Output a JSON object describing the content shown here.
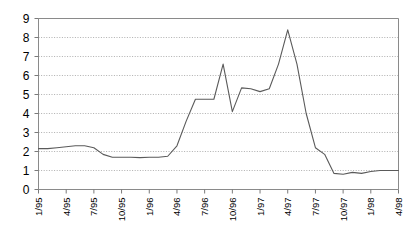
{
  "chart_data": {
    "type": "line",
    "title": "",
    "subtitle": "",
    "xlabel": "",
    "ylabel": "",
    "ylim": [
      0,
      9
    ],
    "yticks": [
      0,
      1,
      2,
      3,
      4,
      5,
      6,
      7,
      8,
      9
    ],
    "ytick_labels": [
      "0",
      "1",
      "2",
      "3",
      "4",
      "5",
      "6",
      "7",
      "8",
      "9"
    ],
    "grid": true,
    "grid_style": "dotted-horizontal",
    "legend": false,
    "legend_position": "none",
    "line_color": "#5a5a5a",
    "background_color": "#ffffff",
    "xtick_labels": [
      "1/95",
      "4/95",
      "7/95",
      "10/95",
      "1/96",
      "4/96",
      "7/96",
      "10/96",
      "1/97",
      "4/97",
      "7/97",
      "10/97",
      "1/98",
      "4/98"
    ],
    "xtick_interval_months": 3,
    "x": [
      "1/95",
      "2/95",
      "3/95",
      "4/95",
      "5/95",
      "6/95",
      "7/95",
      "8/95",
      "9/95",
      "10/95",
      "11/95",
      "12/95",
      "1/96",
      "2/96",
      "3/96",
      "4/96",
      "5/96",
      "6/96",
      "7/96",
      "8/96",
      "9/96",
      "10/96",
      "11/96",
      "12/96",
      "1/97",
      "2/97",
      "3/97",
      "4/97",
      "5/97",
      "6/97",
      "7/97",
      "8/97",
      "9/97",
      "10/97",
      "11/97",
      "12/97",
      "1/98",
      "2/98",
      "3/98",
      "4/98"
    ],
    "series": [
      {
        "name": "series-1",
        "values": [
          2.15,
          2.15,
          2.2,
          2.25,
          2.3,
          2.3,
          2.2,
          1.85,
          1.7,
          1.7,
          1.7,
          1.68,
          1.7,
          1.7,
          1.75,
          2.3,
          3.6,
          4.75,
          4.75,
          4.75,
          6.6,
          4.1,
          5.35,
          5.3,
          5.15,
          5.3,
          6.6,
          8.4,
          6.6,
          4.0,
          2.2,
          1.85,
          0.85,
          0.8,
          0.9,
          0.85,
          0.95,
          1.0,
          1.0,
          1.0
        ]
      }
    ]
  },
  "axes": {
    "y_axis_name": "value-axis",
    "x_axis_name": "time-axis"
  }
}
